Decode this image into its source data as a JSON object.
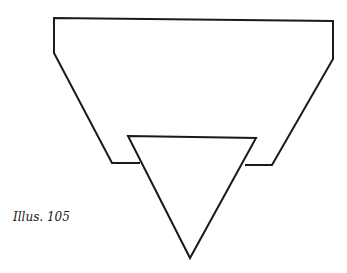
{
  "caption": "Illus. 105",
  "figure": {
    "stroke_color": "#1a1a1a",
    "stroke_width": 2,
    "outer_shape": [
      [
        54,
        18
      ],
      [
        333,
        21
      ],
      [
        333,
        59
      ],
      [
        272,
        165
      ],
      [
        245,
        165
      ]
    ],
    "outer_shape_left": [
      [
        54,
        18
      ],
      [
        54,
        53
      ],
      [
        112,
        163
      ],
      [
        140,
        163
      ]
    ],
    "triangle": [
      [
        128,
        136
      ],
      [
        256,
        138
      ],
      [
        190,
        258
      ]
    ]
  }
}
